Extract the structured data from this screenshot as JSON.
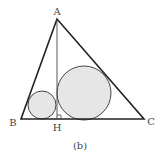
{
  "figure": {
    "caption": "(b)",
    "labels": {
      "A": "A",
      "B": "B",
      "C": "C",
      "H": "H"
    },
    "points": {
      "A": [
        57,
        19
      ],
      "B": [
        21,
        119
      ],
      "C": [
        144,
        119
      ],
      "H": [
        57,
        119
      ]
    },
    "circles": [
      {
        "name": "incircle-ABH",
        "cx": 42,
        "cy": 105,
        "r": 14
      },
      {
        "name": "incircle-AHC",
        "cx": 84,
        "cy": 93,
        "r": 27
      }
    ],
    "colors": {
      "stroke": "#222222",
      "circle_fill": "#e6e6e6",
      "circle_stroke": "#333333",
      "label": "#444444"
    }
  }
}
